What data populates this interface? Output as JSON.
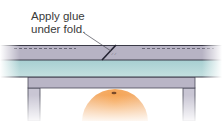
{
  "diagram": {
    "callout": {
      "line1": "Apply glue",
      "line2": "under fold."
    },
    "colors": {
      "fold_band": "#b7b3c4",
      "teal_band": "#9fc9cb",
      "frame": "#b9b5c6",
      "edge": "#3b3b48",
      "fruit": "#f0a868",
      "label_text": "#3a3a3a"
    }
  }
}
